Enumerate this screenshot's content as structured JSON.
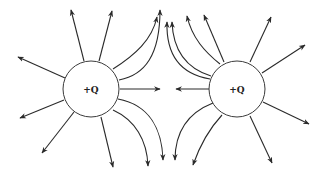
{
  "diagram": {
    "charges": [
      {
        "id": "left",
        "label": "+Q",
        "cx": 91,
        "cy": 89,
        "r": 28
      },
      {
        "id": "right",
        "label": "+Q",
        "cx": 237,
        "cy": 89,
        "r": 28
      }
    ],
    "colors": {
      "line": "#2a2a2a",
      "background": "#ffffff"
    }
  }
}
